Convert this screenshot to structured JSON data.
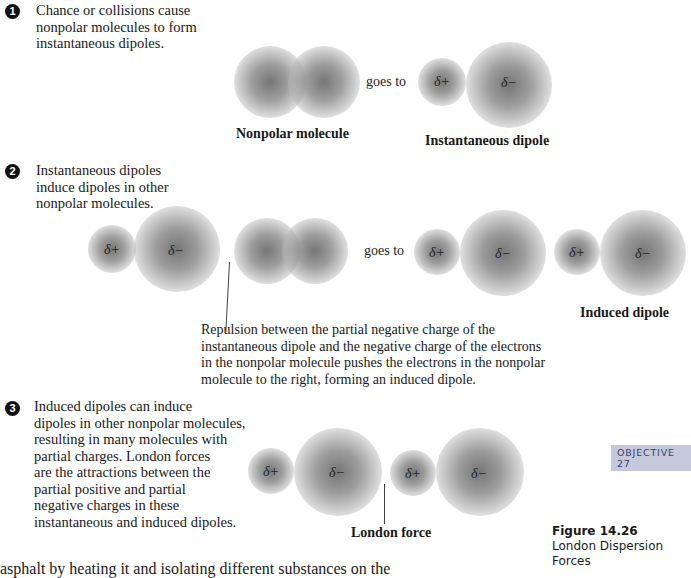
{
  "steps": [
    {
      "number": "1",
      "lines": [
        "Chance or collisions cause",
        "nonpolar molecules to form",
        "instantaneous dipoles."
      ]
    },
    {
      "number": "2",
      "lines": [
        "Instantaneous dipoles",
        "induce dipoles in other",
        "nonpolar molecules."
      ]
    },
    {
      "number": "3",
      "lines": [
        "Induced dipoles can induce",
        "dipoles in other nonpolar molecules,",
        "resulting in many molecules with",
        "partial charges. London forces",
        "are the attractions between the",
        "partial positive and partial",
        "negative charges in these",
        "instantaneous and induced dipoles."
      ]
    }
  ],
  "charges": {
    "positive": "δ+",
    "negative": "δ−"
  },
  "transition_label": "goes to",
  "captions": {
    "nonpolar_molecule": "Nonpolar molecule",
    "instantaneous_dipole": "Instantaneous dipole",
    "induced_dipole": "Induced dipole",
    "london_force": "London force"
  },
  "repulsion_note": [
    "Repulsion between the partial negative charge of the",
    "instantaneous dipole and the negative charge of the electrons",
    "in the nonpolar molecule pushes the electrons in the nonpolar",
    "molecule to the right, forming an induced dipole."
  ],
  "objective_badge": "OBJECTIVE 27",
  "figure": {
    "number": "Figure 14.26",
    "title": "London Dispersion Forces"
  },
  "cutoff_body_text": "asphalt by heating it and isolating different substances on the"
}
